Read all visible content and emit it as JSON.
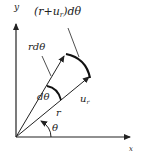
{
  "diagram": {
    "type": "polar-displacement",
    "axes": {
      "y_label": "y",
      "x_label": "x"
    },
    "labels": {
      "outer_arc": "(r+u",
      "outer_arc_sub": "r",
      "outer_arc_tail": ")dθ",
      "inner_arc": "rdθ",
      "angle_increment": "dθ",
      "radial_disp": "u",
      "radial_disp_sub": "r",
      "radius": "r",
      "angle": "θ"
    },
    "colors": {
      "line": "#222222",
      "background": "#ffffff"
    }
  }
}
